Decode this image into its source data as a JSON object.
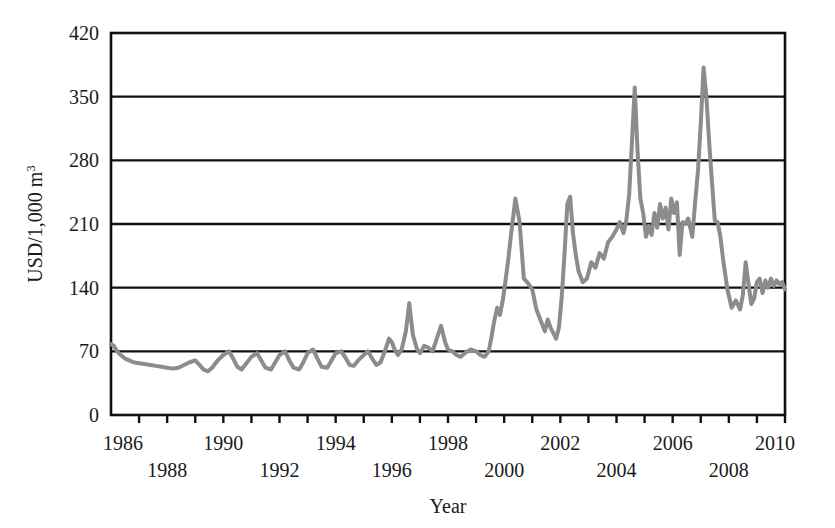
{
  "chart_data": {
    "type": "line",
    "title": "",
    "xlabel": "Year",
    "ylabel": "USD/1,000 m",
    "ylabel_superscript": "3",
    "xlim": [
      1986,
      2010
    ],
    "ylim": [
      0,
      420
    ],
    "yticks": [
      0,
      70,
      140,
      210,
      280,
      350,
      420
    ],
    "ytick_labels": [
      "0",
      "70",
      "140",
      "210",
      "280",
      "350",
      "420"
    ],
    "xticks": [
      1986,
      1987,
      1988,
      1989,
      1990,
      1991,
      1992,
      1993,
      1994,
      1995,
      1996,
      1997,
      1998,
      1999,
      2000,
      2001,
      2002,
      2003,
      2004,
      2005,
      2006,
      2007,
      2008,
      2009,
      2010
    ],
    "xtick_labels_top": [
      "1986",
      "1990",
      "1994",
      "1998",
      "2002",
      "2006",
      "2010"
    ],
    "xtick_labels_bottom": [
      "1988",
      "1992",
      "1996",
      "2000",
      "2004",
      "2008"
    ],
    "grid": true,
    "grid_axis": "y",
    "legend": null,
    "line_color": "#8c8c8c",
    "line_width": 4,
    "axis_color": "#111111",
    "series": [
      {
        "name": "Price",
        "x": [
          1986.0,
          1986.1,
          1986.22,
          1986.35,
          1986.5,
          1986.65,
          1986.8,
          1987.0,
          1987.2,
          1987.4,
          1987.6,
          1987.8,
          1988.0,
          1988.2,
          1988.4,
          1988.6,
          1988.8,
          1989.0,
          1989.15,
          1989.3,
          1989.45,
          1989.6,
          1989.8,
          1990.0,
          1990.2,
          1990.35,
          1990.5,
          1990.65,
          1990.8,
          1991.0,
          1991.2,
          1991.35,
          1991.5,
          1991.7,
          1991.85,
          1992.0,
          1992.2,
          1992.35,
          1992.5,
          1992.7,
          1992.85,
          1993.0,
          1993.2,
          1993.35,
          1993.5,
          1993.7,
          1993.85,
          1994.0,
          1994.2,
          1994.35,
          1994.5,
          1994.65,
          1994.8,
          1995.0,
          1995.15,
          1995.3,
          1995.45,
          1995.6,
          1995.75,
          1995.9,
          1996.0,
          1996.1,
          1996.22,
          1996.35,
          1996.5,
          1996.62,
          1996.75,
          1996.9,
          1997.0,
          1997.15,
          1997.3,
          1997.45,
          1997.6,
          1997.75,
          1997.9,
          1998.0,
          1998.15,
          1998.3,
          1998.45,
          1998.6,
          1998.8,
          1999.0,
          1999.15,
          1999.3,
          1999.45,
          1999.55,
          1999.65,
          1999.75,
          1999.85,
          1999.95,
          2000.05,
          2000.15,
          2000.25,
          2000.4,
          2000.55,
          2000.7,
          2000.85,
          2001.0,
          2001.15,
          2001.3,
          2001.45,
          2001.55,
          2001.65,
          2001.75,
          2001.85,
          2001.95,
          2002.05,
          2002.15,
          2002.25,
          2002.35,
          2002.45,
          2002.55,
          2002.65,
          2002.8,
          2002.95,
          2003.1,
          2003.25,
          2003.4,
          2003.55,
          2003.7,
          2003.85,
          2004.0,
          2004.12,
          2004.25,
          2004.35,
          2004.45,
          2004.55,
          2004.65,
          2004.75,
          2004.85,
          2004.95,
          2005.05,
          2005.15,
          2005.25,
          2005.35,
          2005.45,
          2005.55,
          2005.65,
          2005.75,
          2005.85,
          2005.95,
          2006.05,
          2006.15,
          2006.25,
          2006.35,
          2006.45,
          2006.55,
          2006.7,
          2006.8,
          2006.9,
          2007.0,
          2007.1,
          2007.2,
          2007.3,
          2007.4,
          2007.5,
          2007.6,
          2007.7,
          2007.8,
          2007.95,
          2008.1,
          2008.25,
          2008.4,
          2008.5,
          2008.6,
          2008.7,
          2008.8,
          2008.9,
          2009.0,
          2009.1,
          2009.2,
          2009.3,
          2009.4,
          2009.5,
          2009.6,
          2009.7,
          2009.8,
          2009.9,
          2010.0
        ],
        "y": [
          78,
          76,
          70,
          66,
          62,
          60,
          58,
          57,
          56,
          55,
          54,
          53,
          52,
          51,
          52,
          55,
          58,
          60,
          55,
          50,
          48,
          52,
          60,
          66,
          70,
          62,
          53,
          50,
          56,
          64,
          68,
          60,
          52,
          50,
          58,
          66,
          70,
          60,
          52,
          50,
          58,
          68,
          72,
          62,
          53,
          52,
          60,
          68,
          70,
          63,
          55,
          54,
          60,
          66,
          70,
          62,
          55,
          58,
          70,
          84,
          80,
          72,
          66,
          72,
          92,
          123,
          88,
          72,
          68,
          76,
          74,
          70,
          84,
          98,
          80,
          72,
          70,
          66,
          64,
          68,
          72,
          70,
          66,
          64,
          70,
          86,
          104,
          118,
          110,
          126,
          148,
          172,
          200,
          238,
          212,
          150,
          145,
          138,
          116,
          104,
          92,
          105,
          96,
          90,
          84,
          96,
          130,
          178,
          232,
          240,
          200,
          176,
          158,
          146,
          150,
          168,
          162,
          178,
          172,
          190,
          196,
          204,
          212,
          200,
          214,
          242,
          300,
          360,
          290,
          238,
          222,
          196,
          208,
          198,
          222,
          206,
          232,
          216,
          228,
          204,
          238,
          222,
          234,
          176,
          212,
          210,
          216,
          196,
          234,
          268,
          320,
          382,
          350,
          300,
          256,
          214,
          212,
          196,
          170,
          138,
          118,
          126,
          116,
          132,
          168,
          144,
          122,
          128,
          146,
          150,
          134,
          148,
          140,
          150,
          142,
          148,
          144,
          146,
          138
        ]
      }
    ]
  },
  "axis": {
    "ylabel_text": "USD/1,000 m",
    "ylabel_sup": "3",
    "xlabel_text": "Year"
  }
}
